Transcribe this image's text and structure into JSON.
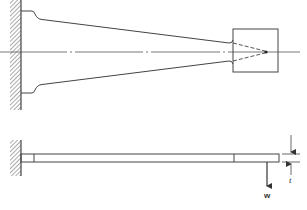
{
  "figure": {
    "colors": {
      "line": "#444444",
      "hatch": "#555555",
      "background": "#ffffff"
    }
  },
  "plan_view": {
    "name": "top view",
    "parts": [
      "fixed-wall",
      "centerline",
      "tapered-beam",
      "end-block",
      "converging-dashed-lines"
    ]
  },
  "side_view": {
    "name": "side elevation",
    "parts": [
      "fixed-wall",
      "beam",
      "load-arrow",
      "thickness-dimension"
    ],
    "labels": {
      "load": "w",
      "thickness": "t"
    }
  }
}
